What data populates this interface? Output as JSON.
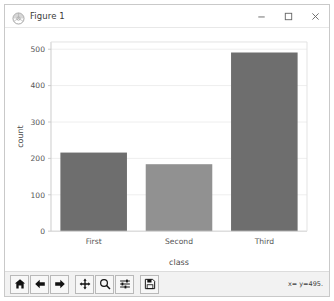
{
  "window": {
    "title": "Figure 1",
    "app_icon": "matplotlib-icon",
    "controls": {
      "minimize": "minimize-button",
      "maximize": "maximize-button",
      "close": "close-button"
    }
  },
  "toolbar": {
    "buttons": [
      {
        "name": "home-button",
        "icon": "home-icon",
        "tooltip": "Home"
      },
      {
        "name": "back-button",
        "icon": "arrow-left-icon",
        "tooltip": "Back"
      },
      {
        "name": "forward-button",
        "icon": "arrow-right-icon",
        "tooltip": "Forward"
      },
      {
        "name": "pan-button",
        "icon": "move-cross-icon",
        "tooltip": "Pan"
      },
      {
        "name": "zoom-button",
        "icon": "magnifier-icon",
        "tooltip": "Zoom to rectangle"
      },
      {
        "name": "configure-subplots-button",
        "icon": "sliders-icon",
        "tooltip": "Configure subplots"
      },
      {
        "name": "save-button",
        "icon": "floppy-disk-icon",
        "tooltip": "Save the figure"
      }
    ],
    "coordinates": "x=      y=495."
  },
  "chart_data": {
    "type": "bar",
    "title": "",
    "xlabel": "class",
    "ylabel": "count",
    "categories": [
      "First",
      "Second",
      "Third"
    ],
    "values": [
      216,
      184,
      491
    ],
    "bar_colors": [
      "#6e6e6e",
      "#919191",
      "#6e6e6e"
    ],
    "ylim": [
      0,
      520
    ],
    "yticks": [
      0,
      100,
      200,
      300,
      400,
      500
    ],
    "ytick_labels": [
      "0",
      "100",
      "200",
      "300",
      "400",
      "500"
    ],
    "grid": true,
    "grid_axis": "y",
    "grid_color": "#eeeeee",
    "legend": false,
    "background": "#ffffff",
    "axis_color": "#cccccc",
    "tick_label_color": "#555555"
  }
}
